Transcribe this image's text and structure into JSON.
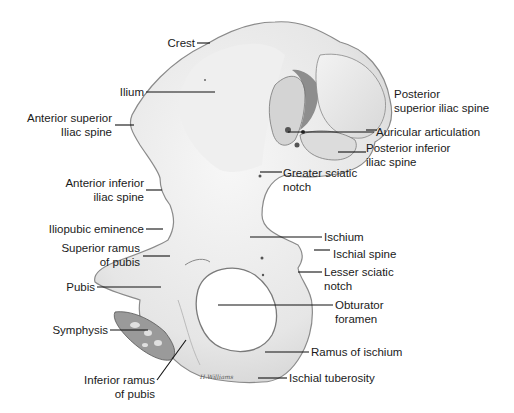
{
  "diagram": {
    "signature": "H.Williams",
    "labels": [
      {
        "id": "crest",
        "lines": [
          "Crest"
        ]
      },
      {
        "id": "ilium",
        "lines": [
          "Ilium"
        ]
      },
      {
        "id": "asis",
        "lines": [
          "Anterior superior",
          "Iliac spine"
        ]
      },
      {
        "id": "aiis",
        "lines": [
          "Anterior inferior",
          "iliac spine"
        ]
      },
      {
        "id": "iliopubic",
        "lines": [
          "Iliopubic eminence"
        ]
      },
      {
        "id": "sup-ramus",
        "lines": [
          "Superior ramus",
          "of pubis"
        ]
      },
      {
        "id": "pubis",
        "lines": [
          "Pubis"
        ]
      },
      {
        "id": "symphysis",
        "lines": [
          "Symphysis"
        ]
      },
      {
        "id": "inf-ramus",
        "lines": [
          "Inferior ramus",
          "of pubis"
        ]
      },
      {
        "id": "psis",
        "lines": [
          "Posterior",
          "superior iliac spine"
        ]
      },
      {
        "id": "auricular",
        "lines": [
          "Auricular articulation"
        ]
      },
      {
        "id": "piis",
        "lines": [
          "Posterior inferior",
          "iliac spine"
        ]
      },
      {
        "id": "greater-sciatic",
        "lines": [
          "Greater sciatic",
          "notch"
        ]
      },
      {
        "id": "ischium",
        "lines": [
          "Ischium"
        ]
      },
      {
        "id": "ischial-spine",
        "lines": [
          "Ischial spine"
        ]
      },
      {
        "id": "lesser-sciatic",
        "lines": [
          "Lesser sciatic",
          "notch"
        ]
      },
      {
        "id": "obturator",
        "lines": [
          "Obturator",
          "foramen"
        ]
      },
      {
        "id": "ramus-ischium",
        "lines": [
          "Ramus of ischium"
        ]
      },
      {
        "id": "ischial-tuberosity",
        "lines": [
          "Ischial tuberosity"
        ]
      }
    ],
    "colors": {
      "bone_fill": "#ececec",
      "bone_shadow": "#bdbdbd",
      "bone_dark": "#6e6e6e",
      "outline": "#8a8a8a",
      "text": "#1a1a1a",
      "leader": "#111111"
    }
  }
}
